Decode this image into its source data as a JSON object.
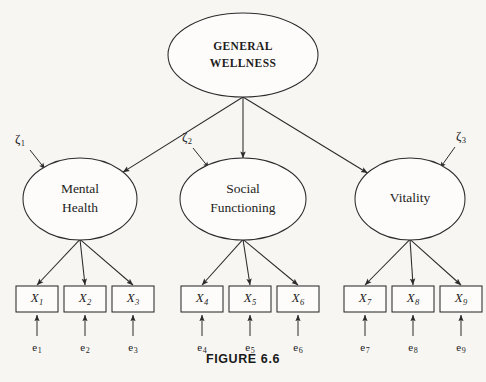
{
  "figure": {
    "caption": "FIGURE 6.6",
    "background_color": "#f7f6f3",
    "ink_color": "#2b2b2b"
  },
  "apex": {
    "name": "general-wellness",
    "line1": "GENERAL",
    "line2": "WELLNESS",
    "cx": 243,
    "cy": 55,
    "rx": 75,
    "ry": 42
  },
  "factors": [
    {
      "name": "mental-health",
      "line1": "Mental",
      "line2": "Health",
      "cx": 80,
      "cy": 199,
      "rx": 57,
      "ry": 41,
      "zeta": "ζ",
      "zeta_sub": "1",
      "zeta_x": 20,
      "zeta_y": 140,
      "zeta_arrow_from": [
        30,
        150
      ],
      "zeta_arrow_to": [
        45,
        169
      ]
    },
    {
      "name": "social-functioning",
      "line1": "Social",
      "line2": "Functioning",
      "cx": 243,
      "cy": 199,
      "rx": 63,
      "ry": 41,
      "zeta": "ζ",
      "zeta_sub": "2",
      "zeta_x": 187,
      "zeta_y": 138,
      "zeta_arrow_from": [
        193,
        148
      ],
      "zeta_arrow_to": [
        209,
        168
      ]
    },
    {
      "name": "vitality",
      "line1": "Vitality",
      "line2": "",
      "cx": 410,
      "cy": 199,
      "rx": 55,
      "ry": 41,
      "zeta": "ζ",
      "zeta_sub": "3",
      "zeta_x": 461,
      "zeta_y": 137,
      "zeta_arrow_from": [
        455,
        147
      ],
      "zeta_arrow_to": [
        440,
        168
      ]
    }
  ],
  "indicators": [
    {
      "name": "x1",
      "label": "X",
      "sub": "1",
      "x": 16,
      "y": 286,
      "w": 42,
      "h": 26,
      "factor": 0,
      "error": "e",
      "error_sub": "1"
    },
    {
      "name": "x2",
      "label": "X",
      "sub": "2",
      "x": 64,
      "y": 286,
      "w": 42,
      "h": 26,
      "factor": 0,
      "error": "e",
      "error_sub": "2"
    },
    {
      "name": "x3",
      "label": "X",
      "sub": "3",
      "x": 112,
      "y": 286,
      "w": 42,
      "h": 26,
      "factor": 0,
      "error": "e",
      "error_sub": "3"
    },
    {
      "name": "x4",
      "label": "X",
      "sub": "4",
      "x": 181,
      "y": 286,
      "w": 42,
      "h": 26,
      "factor": 1,
      "error": "e",
      "error_sub": "4"
    },
    {
      "name": "x5",
      "label": "X",
      "sub": "5",
      "x": 229,
      "y": 286,
      "w": 42,
      "h": 26,
      "factor": 1,
      "error": "e",
      "error_sub": "5"
    },
    {
      "name": "x6",
      "label": "X",
      "sub": "6",
      "x": 277,
      "y": 286,
      "w": 42,
      "h": 26,
      "factor": 1,
      "error": "e",
      "error_sub": "6"
    },
    {
      "name": "x7",
      "label": "X",
      "sub": "7",
      "x": 344,
      "y": 286,
      "w": 42,
      "h": 26,
      "factor": 2,
      "error": "e",
      "error_sub": "7"
    },
    {
      "name": "x8",
      "label": "X",
      "sub": "8",
      "x": 392,
      "y": 286,
      "w": 42,
      "h": 26,
      "factor": 2,
      "error": "e",
      "error_sub": "8"
    },
    {
      "name": "x9",
      "label": "X",
      "sub": "9",
      "x": 440,
      "y": 286,
      "w": 42,
      "h": 26,
      "factor": 2,
      "error": "e",
      "error_sub": "9"
    }
  ],
  "error_label_y": 343,
  "error_arrow_tail_y": 336,
  "error_arrow_head_y": 315
}
